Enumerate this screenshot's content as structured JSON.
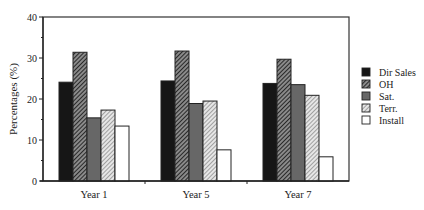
{
  "chart_data": {
    "type": "bar",
    "title": "",
    "xlabel": "",
    "ylabel": "Percentages (%)",
    "ylim": [
      0,
      40
    ],
    "yticks": [
      0,
      10,
      20,
      30,
      40
    ],
    "grid": false,
    "legend_position": "right",
    "categories": [
      "Year 1",
      "Year 5",
      "Year 7"
    ],
    "series": [
      {
        "name": "Dir Sales",
        "fill": "solid-black",
        "color": "#1a1a1a",
        "values": [
          24.1,
          24.4,
          23.8
        ]
      },
      {
        "name": "OH",
        "fill": "dense-diagonal-hatch",
        "color": "#3a3a3a",
        "values": [
          31.4,
          31.7,
          29.7
        ]
      },
      {
        "name": "Sat.",
        "fill": "solid-gray",
        "color": "#6e6e6e",
        "values": [
          15.4,
          18.9,
          23.5
        ]
      },
      {
        "name": "Terr.",
        "fill": "light-diagonal-hatch",
        "color": "#9a9a9a",
        "values": [
          17.3,
          19.5,
          20.9
        ]
      },
      {
        "name": "Install",
        "fill": "white",
        "color": "#ffffff",
        "values": [
          13.4,
          7.6,
          5.9
        ]
      }
    ]
  }
}
